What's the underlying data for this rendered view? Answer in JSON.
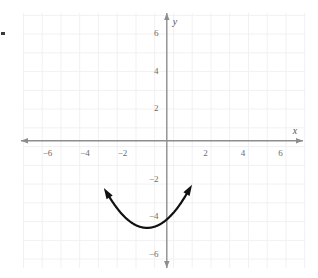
{
  "figure": {
    "title": "",
    "background_color": "#ffffff",
    "grid_color": "#f0f0f2",
    "axis_color": "#8d8d8d",
    "curve_color": "#111111",
    "tick_label_color": "#6b6b6b"
  },
  "axes": {
    "x_axis_label": "x",
    "y_axis_label": "y",
    "x_ticks": [
      {
        "label": "−6",
        "value": -6
      },
      {
        "label": "−4",
        "value": -4
      },
      {
        "label": "−2",
        "value": -2
      },
      {
        "label": "2",
        "value": 2
      },
      {
        "label": "4",
        "value": 4
      },
      {
        "label": "6",
        "value": 6
      }
    ],
    "y_ticks": [
      {
        "label": "6",
        "value": 6
      },
      {
        "label": "4",
        "value": 4
      },
      {
        "label": "2",
        "value": 2
      },
      {
        "label": "−2",
        "value": -2
      },
      {
        "label": "−4",
        "value": -4
      },
      {
        "label": "−6",
        "value": -6
      }
    ]
  },
  "chart_data": {
    "type": "line",
    "title": "",
    "xlabel": "x",
    "ylabel": "y",
    "xlim": [
      -7.2,
      7.2
    ],
    "ylim": [
      -6.7,
      7.0
    ],
    "grid": true,
    "grid_step": 1,
    "legend": "none",
    "series": [
      {
        "name": "parabola",
        "equation": "y = 2x^2 + 4x - 4.3",
        "vertex": [
          -1.05,
          -4.65
        ],
        "x_intercepts": [
          -2.9,
          0.8
        ],
        "y_intercept": -4.2,
        "arrow_ends": [
          [
            -3.05,
            6.65
          ],
          [
            1.05,
            6.65
          ]
        ],
        "x": [
          -3.05,
          -2.8,
          -2.5,
          -2.2,
          -1.9,
          -1.6,
          -1.3,
          -1.05,
          -0.8,
          -0.5,
          -0.2,
          0.1,
          0.4,
          0.7,
          1.05
        ],
        "y": [
          6.65,
          4.6,
          2.85,
          1.25,
          -0.2,
          -1.45,
          -2.5,
          -4.65,
          -4.5,
          -3.9,
          -3.0,
          -1.85,
          -0.4,
          1.3,
          6.65
        ]
      }
    ]
  }
}
